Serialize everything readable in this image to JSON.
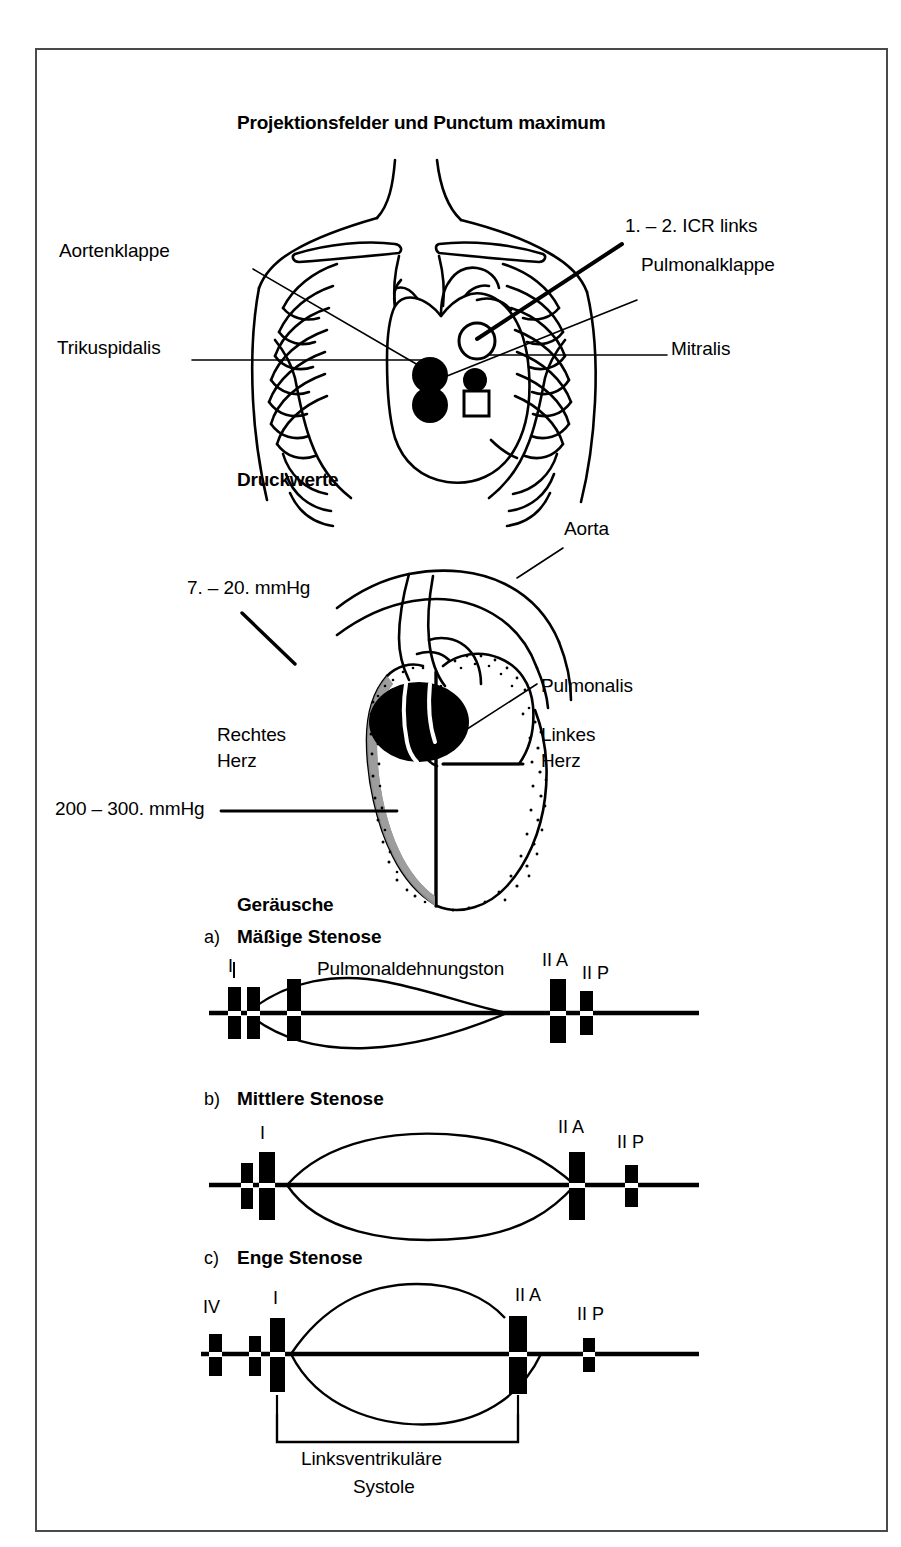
{
  "figure": {
    "sections": [
      {
        "id": "projection",
        "title": "Projektionsfelder und Punctum maximum",
        "labels": [
          {
            "name": "aortenklappe",
            "text": "Aortenklappe"
          },
          {
            "name": "trikuspidalis",
            "text": "Trikuspidalis"
          },
          {
            "name": "icr-links",
            "text": "1. – 2. ICR links"
          },
          {
            "name": "pulmonalklappe",
            "text": "Pulmonalklappe"
          },
          {
            "name": "mitralis",
            "text": "Mitralis"
          }
        ]
      },
      {
        "id": "druckwerte",
        "title": "Druckwerte",
        "labels": [
          {
            "name": "pressure-right",
            "text": "7. – 20. mmHg"
          },
          {
            "name": "aorta",
            "text": "Aorta"
          },
          {
            "name": "pulmonalis",
            "text": "Pulmonalis"
          },
          {
            "name": "rechtes-herz-line1",
            "text": "Rechtes"
          },
          {
            "name": "rechtes-herz-line2",
            "text": "Herz"
          },
          {
            "name": "linkes-herz-line1",
            "text": "Linkes"
          },
          {
            "name": "linkes-herz-line2",
            "text": "Herz"
          },
          {
            "name": "pressure-left",
            "text": "200 – 300. mmHg"
          }
        ]
      },
      {
        "id": "geraeusche",
        "title": "Geräusche",
        "traces": [
          {
            "letter": "a)",
            "title": "Mäßige Stenose",
            "annotation": "Pulmonaldehnungston",
            "marks": [
              {
                "name": "mark-I",
                "label": "I"
              },
              {
                "name": "mark-IIA",
                "label": "II A"
              },
              {
                "name": "mark-IIP",
                "label": "II P"
              }
            ]
          },
          {
            "letter": "b)",
            "title": "Mittlere Stenose",
            "annotation": "",
            "marks": [
              {
                "name": "mark-I",
                "label": "I"
              },
              {
                "name": "mark-IIA",
                "label": "II A"
              },
              {
                "name": "mark-IIP",
                "label": "II P"
              }
            ]
          },
          {
            "letter": "c)",
            "title": "Enge Stenose",
            "annotation": "",
            "marks": [
              {
                "name": "mark-IV",
                "label": "IV"
              },
              {
                "name": "mark-I",
                "label": "I"
              },
              {
                "name": "mark-IIA",
                "label": "II A"
              },
              {
                "name": "mark-IIP",
                "label": "II P"
              }
            ]
          }
        ],
        "bracket_caption_line1": "Linksventrikuläre",
        "bracket_caption_line2": "Systole"
      }
    ],
    "colors": {
      "ink": "#000000",
      "frame": "#4a4a4a",
      "paper": "#ffffff"
    }
  }
}
